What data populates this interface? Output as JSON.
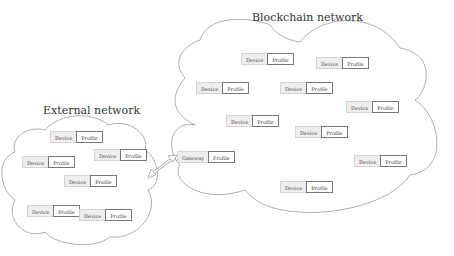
{
  "blockchain_network": {
    "title": "Blockchain network",
    "nodes": [
      {
        "device": "Device",
        "profile": "Profile",
        "x": 241,
        "y": 53
      },
      {
        "device": "Device",
        "profile": "Profile",
        "x": 316,
        "y": 57
      },
      {
        "device": "Device",
        "profile": "Profile",
        "x": 196,
        "y": 82
      },
      {
        "device": "Device",
        "profile": "Profile",
        "x": 280,
        "y": 82
      },
      {
        "device": "Device",
        "profile": "Profile",
        "x": 346,
        "y": 101
      },
      {
        "device": "Device",
        "profile": "Profile",
        "x": 226,
        "y": 115
      },
      {
        "device": "Device",
        "profile": "Profile",
        "x": 295,
        "y": 126
      },
      {
        "device": "Device",
        "profile": "Profile",
        "x": 354,
        "y": 155
      },
      {
        "device": "Device",
        "profile": "Profile",
        "x": 280,
        "y": 181
      }
    ],
    "gateway": {
      "device": "Gateway",
      "profile": "Profile",
      "x": 177,
      "y": 151
    }
  },
  "external_network": {
    "title": "External network",
    "nodes": [
      {
        "device": "Device",
        "profile": "Profile",
        "x": 50,
        "y": 131
      },
      {
        "device": "Device",
        "profile": "Profile",
        "x": 94,
        "y": 149
      },
      {
        "device": "Device",
        "profile": "Profile",
        "x": 22,
        "y": 156
      },
      {
        "device": "Device",
        "profile": "Profile",
        "x": 64,
        "y": 175
      },
      {
        "device": "Device",
        "profile": "Profile",
        "x": 27,
        "y": 205
      },
      {
        "device": "Device",
        "profile": "Profile",
        "x": 79,
        "y": 209
      }
    ]
  },
  "connection": {
    "type": "bidirectional-arrow",
    "from": "External network",
    "to": "Gateway"
  },
  "colors": {
    "cloud_stroke": "#9a9a9a",
    "device_bg": "#eeeeee",
    "profile_border": "#777777",
    "text": "#444444"
  }
}
